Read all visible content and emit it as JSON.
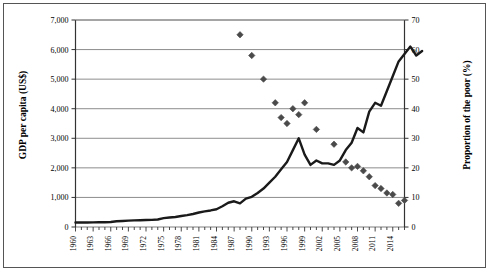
{
  "chart_data": {
    "type": "line",
    "title": "",
    "xlabel": "",
    "ylabel_left": "GDP per capita (US$)",
    "ylabel_right": "Proportion of the poor (%)",
    "xlim": [
      1960,
      2016
    ],
    "ylim_left": [
      0,
      7000
    ],
    "ylim_right": [
      0,
      70
    ],
    "grid": true,
    "legend": "none",
    "left_ticks": [
      "0",
      "1,000",
      "2,000",
      "3,000",
      "4,000",
      "5,000",
      "6,000",
      "7,000"
    ],
    "left_tick_values": [
      0,
      1000,
      2000,
      3000,
      4000,
      5000,
      6000,
      7000
    ],
    "right_ticks": [
      "0",
      "10",
      "20",
      "30",
      "40",
      "50",
      "60",
      "70"
    ],
    "right_tick_values": [
      0,
      10,
      20,
      30,
      40,
      50,
      60,
      70
    ],
    "x_tick_labels": [
      "1960",
      "1963",
      "1966",
      "1969",
      "1972",
      "1975",
      "1978",
      "1981",
      "1984",
      "1987",
      "1990",
      "1993",
      "1996",
      "1999",
      "2002",
      "2005",
      "2008",
      "2011",
      "2014"
    ],
    "x_tick_values": [
      1960,
      1963,
      1966,
      1969,
      1972,
      1975,
      1978,
      1981,
      1984,
      1987,
      1990,
      1993,
      1996,
      1999,
      2002,
      2005,
      2008,
      2011,
      2014
    ],
    "series": [
      {
        "name": "GDP per capita (US$)",
        "type": "line",
        "axis": "left",
        "color": "#1a1a1a",
        "x": [
          1960,
          1961,
          1962,
          1963,
          1964,
          1965,
          1966,
          1967,
          1968,
          1969,
          1970,
          1971,
          1972,
          1973,
          1974,
          1975,
          1976,
          1977,
          1978,
          1979,
          1980,
          1981,
          1982,
          1983,
          1984,
          1985,
          1986,
          1987,
          1988,
          1989,
          1990,
          1991,
          1992,
          1993,
          1994,
          1995,
          1996,
          1997,
          1998,
          1999,
          2000,
          2001,
          2002,
          2003,
          2004,
          2005,
          2006,
          2007,
          2008,
          2009,
          2010,
          2011,
          2012,
          2013,
          2014,
          2015,
          2016
        ],
        "values": [
          150,
          150,
          150,
          155,
          160,
          160,
          170,
          195,
          205,
          215,
          225,
          230,
          235,
          240,
          255,
          300,
          320,
          340,
          370,
          400,
          440,
          490,
          530,
          560,
          600,
          700,
          820,
          870,
          800,
          960,
          1020,
          1150,
          1300,
          1500,
          1700,
          1950,
          2200,
          2600,
          3000,
          2450,
          2100,
          2250,
          2150,
          2150,
          2100,
          2250,
          2600,
          2850,
          3350,
          3200,
          3900,
          4200,
          4100,
          4600,
          5100,
          5600,
          5850
        ],
        "key_points": {
          "1960": 150,
          "1970": 225,
          "1980": 440,
          "1987": 870,
          "1988": 800,
          "1997": 2600,
          "1998": 3000,
          "1999": 2450,
          "2000": 2100,
          "2008": 3350,
          "2009": 3200,
          "2011": 4200,
          "2012": 4100,
          "2016": 5850
        },
        "peak": {
          "year": 2018,
          "value": 6100
        },
        "tail": {
          "values": [
            6100,
            5800,
            5950
          ]
        }
      },
      {
        "name": "Proportion of the poor (%)",
        "type": "scatter",
        "axis": "right",
        "marker": "diamond",
        "color": "#4a4a4a",
        "points": [
          {
            "x": 1988,
            "y": 65
          },
          {
            "x": 1990,
            "y": 58
          },
          {
            "x": 1992,
            "y": 50
          },
          {
            "x": 1994,
            "y": 42
          },
          {
            "x": 1995,
            "y": 37
          },
          {
            "x": 1996,
            "y": 35
          },
          {
            "x": 1997,
            "y": 40
          },
          {
            "x": 1998,
            "y": 38
          },
          {
            "x": 1999,
            "y": 42
          },
          {
            "x": 2001,
            "y": 33
          },
          {
            "x": 2004,
            "y": 28
          },
          {
            "x": 2006,
            "y": 22
          },
          {
            "x": 2007,
            "y": 20
          },
          {
            "x": 2008,
            "y": 20.5
          },
          {
            "x": 2009,
            "y": 19
          },
          {
            "x": 2010,
            "y": 17
          },
          {
            "x": 2011,
            "y": 14
          },
          {
            "x": 2012,
            "y": 13
          },
          {
            "x": 2013,
            "y": 11.5
          },
          {
            "x": 2014,
            "y": 11
          },
          {
            "x": 2015,
            "y": 8
          },
          {
            "x": 2016,
            "y": 9
          }
        ]
      }
    ]
  },
  "axes": {
    "left_title": "GDP per capita (US$)",
    "right_title": "Proportion of the poor (%)"
  }
}
